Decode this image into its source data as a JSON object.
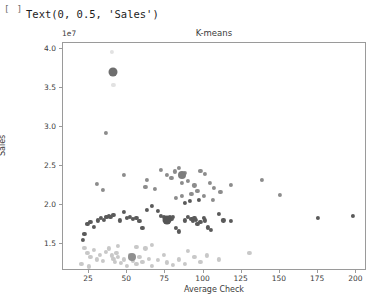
{
  "notebook": {
    "prompt": "[ ]",
    "text_output": "Text(0, 0.5, 'Sales')"
  },
  "figure": {
    "title": "K-means",
    "y_offset_text": "1e7",
    "xlabel": "Average Check",
    "ylabel": "Sales",
    "xticks": [
      "25",
      "50",
      "75",
      "100",
      "125",
      "150",
      "175",
      "200"
    ],
    "yticks": [
      "1.5",
      "2.0",
      "2.5",
      "3.0",
      "3.5",
      "4.0"
    ]
  },
  "chart_data": {
    "type": "scatter",
    "title": "K-means",
    "xlabel": "Average Check",
    "ylabel": "Sales",
    "xlim": [
      8,
      207
    ],
    "ylim": [
      1.15,
      4.08
    ],
    "y_scale_offset": "1e7",
    "grid": false,
    "legend": null,
    "xtick_values": [
      25,
      50,
      75,
      100,
      125,
      150,
      175,
      200
    ],
    "ytick_values": [
      1.5,
      2.0,
      2.5,
      3.0,
      3.5,
      4.0
    ],
    "cluster_colors": {
      "cluster_0": "#5a5a5a",
      "cluster_1": "#8c8c8c",
      "cluster_2": "#c8c8c8",
      "cluster_3": "#e2e2e2"
    },
    "series": [
      {
        "name": "cluster_0",
        "color": "#5a5a5a",
        "marker_size": 4.2,
        "points": [
          [
            22,
            1.63
          ],
          [
            24,
            1.76
          ],
          [
            26,
            1.78
          ],
          [
            28,
            1.72
          ],
          [
            31,
            1.8
          ],
          [
            33,
            1.83
          ],
          [
            35,
            1.81
          ],
          [
            36,
            1.85
          ],
          [
            37,
            1.84
          ],
          [
            38,
            1.86
          ],
          [
            39,
            1.85
          ],
          [
            41,
            1.87
          ],
          [
            21,
            1.55
          ],
          [
            45,
            1.8
          ],
          [
            48,
            1.91
          ],
          [
            50,
            1.83
          ],
          [
            52,
            1.84
          ],
          [
            54,
            1.82
          ],
          [
            56,
            1.83
          ],
          [
            58,
            1.79
          ],
          [
            60,
            1.7
          ],
          [
            63,
            1.93
          ],
          [
            66,
            1.99
          ],
          [
            70,
            1.92
          ],
          [
            72,
            1.86
          ],
          [
            74,
            1.84
          ],
          [
            76,
            1.83
          ],
          [
            78,
            1.85
          ],
          [
            79,
            1.82
          ],
          [
            80,
            1.84
          ],
          [
            82,
            1.7
          ],
          [
            84,
            1.66
          ],
          [
            88,
            1.8
          ],
          [
            90,
            1.84
          ],
          [
            92,
            1.82
          ],
          [
            93,
            1.79
          ],
          [
            94,
            1.83
          ],
          [
            95,
            1.81
          ],
          [
            96,
            1.76
          ],
          [
            98,
            1.78
          ],
          [
            100,
            1.83
          ],
          [
            101,
            1.8
          ],
          [
            103,
            1.71
          ],
          [
            105,
            1.68
          ],
          [
            110,
            1.88
          ],
          [
            113,
            1.8
          ],
          [
            118,
            1.79
          ],
          [
            175,
            1.83
          ],
          [
            198,
            1.86
          ],
          [
            88,
            2.02
          ],
          [
            91,
            2.05
          ],
          [
            97,
            2.06
          ]
        ]
      },
      {
        "name": "cluster_1",
        "color": "#8c8c8c",
        "marker_size": 4.2,
        "points": [
          [
            41,
            3.71
          ],
          [
            36,
            2.92
          ],
          [
            48,
            2.38
          ],
          [
            63,
            2.32
          ],
          [
            72,
            2.45
          ],
          [
            84,
            2.47
          ],
          [
            76,
            2.39
          ],
          [
            79,
            2.35
          ],
          [
            81,
            2.43
          ],
          [
            86,
            2.28
          ],
          [
            88,
            2.41
          ],
          [
            90,
            2.31
          ],
          [
            94,
            2.25
          ],
          [
            98,
            2.44
          ],
          [
            101,
            2.4
          ],
          [
            104,
            2.28
          ],
          [
            107,
            2.22
          ],
          [
            96,
            2.18
          ],
          [
            92,
            2.14
          ],
          [
            100,
            2.11
          ],
          [
            106,
            2.06
          ],
          [
            111,
            2.17
          ],
          [
            118,
            2.26
          ],
          [
            138,
            2.32
          ],
          [
            150,
            2.13
          ],
          [
            68,
            2.21
          ],
          [
            62,
            2.23
          ],
          [
            30,
            2.27
          ],
          [
            34,
            2.19
          ],
          [
            86,
            2.12
          ],
          [
            82,
            2.09
          ]
        ]
      },
      {
        "name": "cluster_2",
        "color": "#c8c8c8",
        "marker_size": 4.2,
        "points": [
          [
            22,
            1.45
          ],
          [
            24,
            1.38
          ],
          [
            26,
            1.33
          ],
          [
            28,
            1.42
          ],
          [
            30,
            1.3
          ],
          [
            32,
            1.36
          ],
          [
            34,
            1.28
          ],
          [
            36,
            1.4
          ],
          [
            38,
            1.44
          ],
          [
            40,
            1.35
          ],
          [
            41,
            1.31
          ],
          [
            42,
            1.27
          ],
          [
            43,
            1.38
          ],
          [
            44,
            1.33
          ],
          [
            46,
            1.25
          ],
          [
            48,
            1.3
          ],
          [
            50,
            1.22
          ],
          [
            52,
            1.36
          ],
          [
            54,
            1.28
          ],
          [
            56,
            1.24
          ],
          [
            58,
            1.33
          ],
          [
            60,
            1.27
          ],
          [
            62,
            1.44
          ],
          [
            64,
            1.31
          ],
          [
            66,
            1.22
          ],
          [
            70,
            1.29
          ],
          [
            74,
            1.36
          ],
          [
            76,
            1.26
          ],
          [
            80,
            1.23
          ],
          [
            84,
            1.3
          ],
          [
            88,
            1.24
          ],
          [
            90,
            1.41
          ],
          [
            94,
            1.33
          ],
          [
            98,
            1.27
          ],
          [
            102,
            1.35
          ],
          [
            110,
            1.3
          ],
          [
            130,
            1.38
          ],
          [
            20,
            1.24
          ],
          [
            25,
            1.21
          ],
          [
            44,
            1.47
          ],
          [
            66,
            1.49
          ],
          [
            56,
            1.46
          ]
        ]
      },
      {
        "name": "cluster_3",
        "color": "#e2e2e2",
        "marker_size": 4.2,
        "points": [
          [
            40,
            3.97
          ],
          [
            41,
            3.54
          ]
        ]
      }
    ],
    "centroids": [
      {
        "cluster": "cluster_1",
        "x": 41,
        "y": 3.71,
        "color": "#6e6e6e",
        "marker_size": 9
      },
      {
        "cluster": "cluster_1",
        "x": 86,
        "y": 2.38,
        "color": "#7d7d7d",
        "marker_size": 8
      },
      {
        "cluster": "cluster_0",
        "x": 76,
        "y": 1.8,
        "color": "#555555",
        "marker_size": 9
      },
      {
        "cluster": "cluster_2",
        "x": 53,
        "y": 1.33,
        "color": "#8f8f8f",
        "marker_size": 8
      }
    ]
  }
}
